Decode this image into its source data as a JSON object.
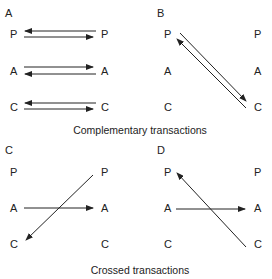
{
  "panels": [
    {
      "id": "A",
      "title": "A",
      "left_nodes": [
        "P",
        "A",
        "C"
      ],
      "right_nodes": [
        "P",
        "A",
        "C"
      ],
      "arrows": [
        {
          "from": "right P",
          "to": "left P"
        },
        {
          "from": "left P",
          "to": "right P"
        },
        {
          "from": "left A",
          "to": "right A"
        },
        {
          "from": "right A",
          "to": "left A"
        },
        {
          "from": "right C",
          "to": "left C"
        },
        {
          "from": "left C",
          "to": "right C"
        }
      ]
    },
    {
      "id": "B",
      "title": "B",
      "left_nodes": [
        "P",
        "A",
        "C"
      ],
      "right_nodes": [
        "P",
        "A",
        "C"
      ],
      "arrows": [
        {
          "from": "left P",
          "to": "right C"
        },
        {
          "from": "right C",
          "to": "left P"
        }
      ]
    },
    {
      "id": "C",
      "title": "C",
      "left_nodes": [
        "P",
        "A",
        "C"
      ],
      "right_nodes": [
        "P",
        "A",
        "C"
      ],
      "arrows": [
        {
          "from": "left A",
          "to": "right A"
        },
        {
          "from": "right P",
          "to": "left C"
        }
      ]
    },
    {
      "id": "D",
      "title": "D",
      "left_nodes": [
        "P",
        "A",
        "C"
      ],
      "right_nodes": [
        "P",
        "A",
        "C"
      ],
      "arrows": [
        {
          "from": "left A",
          "to": "right A"
        },
        {
          "from": "right C",
          "to": "left P"
        }
      ]
    }
  ],
  "captions": {
    "top": "Complementary transactions",
    "bottom": "Crossed transactions"
  }
}
